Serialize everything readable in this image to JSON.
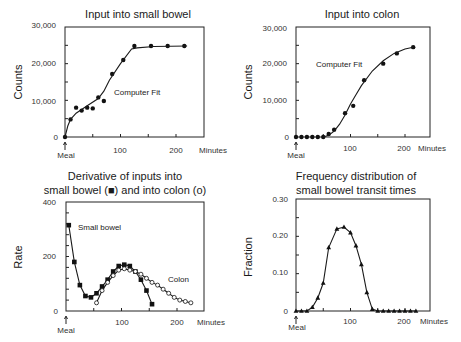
{
  "chart_data": [
    {
      "type": "scatter",
      "title": "Input into small bowel",
      "xlabel": "Minutes",
      "ylabel": "Counts",
      "xlim": [
        0,
        250
      ],
      "ylim": [
        0,
        30000
      ],
      "xticks": [
        "100",
        "200"
      ],
      "yticks": [
        "0",
        "10,000",
        "20,000",
        "30,000"
      ],
      "x_origin_label": "Meal",
      "annotation": "Computer Fit",
      "series": [
        {
          "name": "Observed",
          "marker": "filled-circle",
          "x": [
            0,
            10,
            20,
            30,
            40,
            50,
            60,
            70,
            85,
            105,
            125,
            155,
            185,
            215
          ],
          "y": [
            0,
            4800,
            8000,
            7200,
            8000,
            7800,
            10800,
            9800,
            17200,
            21000,
            24800,
            24800,
            24800,
            24800
          ]
        },
        {
          "name": "Computer Fit",
          "line": true,
          "x": [
            0,
            5,
            10,
            20,
            40,
            60,
            70,
            80,
            100,
            120,
            130,
            160,
            220
          ],
          "y": [
            0,
            3000,
            4800,
            6500,
            8500,
            10500,
            12500,
            15500,
            20000,
            24000,
            24300,
            24700,
            24800
          ]
        }
      ]
    },
    {
      "type": "scatter",
      "title": "Input into colon",
      "xlabel": "Minutes",
      "ylabel": "Counts",
      "xlim": [
        0,
        250
      ],
      "ylim": [
        0,
        30000
      ],
      "xticks": [
        "100",
        "200"
      ],
      "yticks": [
        "0",
        "10,000",
        "20,000",
        "30,000"
      ],
      "x_origin_label": "Meal",
      "annotation": "Computer Fit",
      "series": [
        {
          "name": "Observed",
          "marker": "filled-circle",
          "x": [
            0,
            10,
            20,
            30,
            40,
            50,
            60,
            70,
            90,
            105,
            125,
            160,
            185,
            215
          ],
          "y": [
            0,
            0,
            0,
            0,
            0,
            0,
            800,
            2000,
            6500,
            8500,
            15500,
            20000,
            22800,
            24500
          ]
        },
        {
          "name": "Computer Fit",
          "line": true,
          "x": [
            50,
            60,
            70,
            80,
            90,
            100,
            110,
            120,
            140,
            160,
            180,
            200,
            215
          ],
          "y": [
            0,
            500,
            1600,
            3500,
            6000,
            9000,
            11500,
            14000,
            18000,
            20800,
            22800,
            24000,
            24500
          ]
        }
      ]
    },
    {
      "type": "line",
      "title": "Derivative of inputs into small bowel (■) and into colon (o)",
      "xlabel": "Minutes",
      "ylabel": "Rate",
      "xlim": [
        0,
        250
      ],
      "ylim": [
        0,
        400
      ],
      "xticks": [
        "100",
        "200"
      ],
      "yticks": [
        "0",
        "200",
        "400"
      ],
      "x_origin_label": "Meal",
      "series": [
        {
          "name": "Small bowel",
          "marker": "filled-square",
          "x": [
            5,
            15,
            25,
            35,
            45,
            55,
            65,
            75,
            85,
            95,
            105,
            115,
            125,
            135,
            145,
            155
          ],
          "y": [
            315,
            180,
            95,
            55,
            50,
            65,
            90,
            115,
            145,
            165,
            170,
            165,
            145,
            115,
            75,
            25
          ]
        },
        {
          "name": "Colon",
          "marker": "open-circle",
          "x": [
            55,
            65,
            75,
            85,
            95,
            105,
            115,
            125,
            135,
            145,
            155,
            165,
            175,
            185,
            195,
            205,
            215,
            225
          ],
          "y": [
            30,
            75,
            105,
            130,
            150,
            155,
            150,
            145,
            135,
            120,
            105,
            95,
            80,
            65,
            50,
            40,
            35,
            30
          ]
        }
      ]
    },
    {
      "type": "line",
      "title": "Frequency distribution of small bowel transit times",
      "xlabel": "Minutes",
      "ylabel": "Fraction",
      "xlim": [
        0,
        250
      ],
      "ylim": [
        0,
        0.3
      ],
      "xticks": [
        "100",
        "200"
      ],
      "yticks": [
        "0",
        "0.10",
        "0.20",
        "0.30"
      ],
      "x_origin_label": "Meal",
      "series": [
        {
          "name": "Transit time fraction",
          "marker": "filled-triangle",
          "x": [
            0,
            10,
            20,
            30,
            40,
            50,
            60,
            75,
            88,
            100,
            110,
            120,
            130,
            140,
            150,
            160,
            170,
            180,
            190,
            200,
            210,
            220
          ],
          "y": [
            0,
            0,
            0,
            0.01,
            0.035,
            0.075,
            0.17,
            0.22,
            0.225,
            0.21,
            0.175,
            0.125,
            0.05,
            0.005,
            0,
            0,
            0,
            0,
            0,
            0,
            0,
            0
          ]
        }
      ]
    }
  ],
  "labels": {
    "p1_title": "Input into small bowel",
    "p2_title": "Input into colon",
    "p3_title_line1": "Derivative of inputs into",
    "p3_title_line2": "small bowel (■) and into colon (o)",
    "p4_title_line1": "Frequency distribution of",
    "p4_title_line2": "small bowel transit times",
    "counts": "Counts",
    "rate": "Rate",
    "fraction": "Fraction",
    "minutes": "Minutes",
    "meal": "Meal",
    "computer_fit": "Computer Fit",
    "small_bowel": "Small bowel",
    "colon": "Colon",
    "t100": "100",
    "t200": "200",
    "y0": "0",
    "y10k": "10,000",
    "y20k": "20,000",
    "y30k": "30,000",
    "y200": "200",
    "y400": "400",
    "f0": "0",
    "f10": "0.10",
    "f20": "0.20",
    "f30": "0.30",
    "meal_arrow": "↑"
  }
}
